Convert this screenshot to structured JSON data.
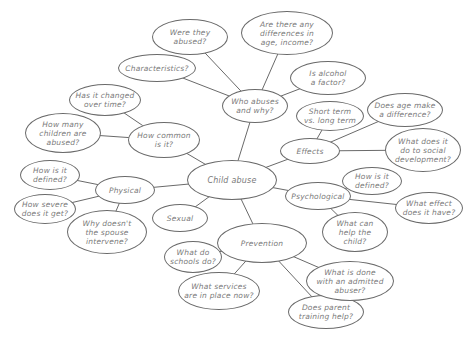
{
  "diagram": {
    "type": "mind-map",
    "center": {
      "id": "child-abuse",
      "label": "Child abuse",
      "x": 232,
      "y": 180,
      "rx": 45,
      "ry": 20
    },
    "nodes": [
      {
        "id": "who-abuses",
        "label": "Who abuses\nand why?",
        "x": 255,
        "y": 106,
        "rx": 33,
        "ry": 17,
        "parent": "child-abuse"
      },
      {
        "id": "were-they-abused",
        "label": "Were they\nabused?",
        "x": 190,
        "y": 37,
        "rx": 38,
        "ry": 18,
        "parent": "who-abuses"
      },
      {
        "id": "differences",
        "label": "Are there any\ndifferences in\nage, income?",
        "x": 287,
        "y": 33,
        "rx": 46,
        "ry": 22,
        "parent": "who-abuses"
      },
      {
        "id": "characteristics",
        "label": "Characteristics?",
        "x": 157,
        "y": 68,
        "rx": 39,
        "ry": 14,
        "parent": "who-abuses"
      },
      {
        "id": "alcohol",
        "label": "Is alcohol\na factor?",
        "x": 328,
        "y": 78,
        "rx": 38,
        "ry": 17,
        "parent": "who-abuses"
      },
      {
        "id": "how-common",
        "label": "How common\nis it?",
        "x": 164,
        "y": 140,
        "rx": 36,
        "ry": 18,
        "parent": "child-abuse"
      },
      {
        "id": "changed-over-time",
        "label": "Has it changed\nover time?",
        "x": 105,
        "y": 100,
        "rx": 36,
        "ry": 16,
        "parent": "how-common"
      },
      {
        "id": "how-many",
        "label": "How many\nchildren are\nabused?",
        "x": 63,
        "y": 133,
        "rx": 38,
        "ry": 20,
        "parent": "how-common"
      },
      {
        "id": "effects",
        "label": "Effects",
        "x": 310,
        "y": 151,
        "rx": 30,
        "ry": 13,
        "parent": "child-abuse"
      },
      {
        "id": "short-long",
        "label": "Short term\nvs. long term",
        "x": 330,
        "y": 116,
        "rx": 34,
        "ry": 15,
        "parent": "effects"
      },
      {
        "id": "age-difference",
        "label": "Does age make\na difference?",
        "x": 405,
        "y": 110,
        "rx": 38,
        "ry": 17,
        "parent": "effects"
      },
      {
        "id": "social-development",
        "label": "What does it\ndo to social\ndevelopment?",
        "x": 423,
        "y": 150,
        "rx": 38,
        "ry": 22,
        "parent": "effects"
      },
      {
        "id": "physical",
        "label": "Physical",
        "x": 125,
        "y": 190,
        "rx": 30,
        "ry": 14,
        "parent": "child-abuse"
      },
      {
        "id": "physical-defined",
        "label": "How is it\ndefined?",
        "x": 50,
        "y": 175,
        "rx": 30,
        "ry": 15,
        "parent": "physical"
      },
      {
        "id": "how-severe",
        "label": "How severe\ndoes it get?",
        "x": 45,
        "y": 209,
        "rx": 31,
        "ry": 15,
        "parent": "physical"
      },
      {
        "id": "spouse-intervene",
        "label": "Why doesn't\nthe spouse\nintervene?",
        "x": 107,
        "y": 232,
        "rx": 40,
        "ry": 22,
        "parent": "physical"
      },
      {
        "id": "sexual",
        "label": "Sexual",
        "x": 180,
        "y": 218,
        "rx": 28,
        "ry": 14,
        "parent": "child-abuse"
      },
      {
        "id": "psychological",
        "label": "Psychological",
        "x": 318,
        "y": 196,
        "rx": 33,
        "ry": 14,
        "parent": "child-abuse"
      },
      {
        "id": "psych-defined",
        "label": "How is it\ndefined?",
        "x": 372,
        "y": 181,
        "rx": 30,
        "ry": 14,
        "parent": "psychological"
      },
      {
        "id": "what-effect",
        "label": "What effect\ndoes it have?",
        "x": 429,
        "y": 208,
        "rx": 34,
        "ry": 16,
        "parent": "psychological"
      },
      {
        "id": "help-child",
        "label": "What can\nhelp the\nchild?",
        "x": 355,
        "y": 232,
        "rx": 33,
        "ry": 20,
        "parent": "psychological"
      },
      {
        "id": "prevention",
        "label": "Prevention",
        "x": 262,
        "y": 243,
        "rx": 45,
        "ry": 20,
        "parent": "child-abuse"
      },
      {
        "id": "schools",
        "label": "What do\nschools do?",
        "x": 193,
        "y": 257,
        "rx": 29,
        "ry": 16,
        "parent": "prevention"
      },
      {
        "id": "services",
        "label": "What services\nare in place now?",
        "x": 219,
        "y": 291,
        "rx": 41,
        "ry": 19,
        "parent": "prevention"
      },
      {
        "id": "parent-training",
        "label": "Does parent\ntraining help?",
        "x": 326,
        "y": 312,
        "rx": 38,
        "ry": 17,
        "parent": "prevention"
      },
      {
        "id": "admitted-abuser",
        "label": "What is done\nwith an admitted\nabuser?",
        "x": 350,
        "y": 281,
        "rx": 44,
        "ry": 20,
        "parent": "prevention"
      }
    ],
    "colors": {
      "line": "#6a6a6a",
      "text": "#7a7a7a",
      "background": "#ffffff"
    }
  }
}
